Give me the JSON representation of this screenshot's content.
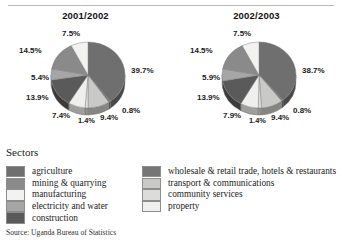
{
  "header": {
    "divider": "horizontal-rule"
  },
  "charts": [
    {
      "title": "2001/2002",
      "labels": [
        "39.7%",
        "0.8%",
        "9.4%",
        "1.4%",
        "7.4%",
        "13.9%",
        "5.4%",
        "14.5%",
        "7.5%"
      ]
    },
    {
      "title": "2002/2003",
      "labels": [
        "38.7%",
        "0.8%",
        "9.4%",
        "1.4%",
        "7.9%",
        "13.9%",
        "5.9%",
        "14.5%",
        "7.5%"
      ]
    }
  ],
  "legend": {
    "title": "Sectors",
    "left_items": [
      {
        "label": "agriculture",
        "color": "#6f6f6f"
      },
      {
        "label": "mining & quarrying",
        "color": "#8a8a8a"
      },
      {
        "label": "manufacturing",
        "color": "#f2f2f0"
      },
      {
        "label": "electricity and water",
        "color": "#a6a6a6"
      },
      {
        "label": "construction",
        "color": "#5a5a5a"
      }
    ],
    "right_items": [
      {
        "label": "wholesale & retail trade, hotels & restaurants",
        "color": "#767676"
      },
      {
        "label": "transport & communications",
        "color": "#c9c9c7"
      },
      {
        "label": "community services",
        "color": "#dcdcda"
      },
      {
        "label": "property",
        "color": "#efefed"
      }
    ]
  },
  "source": "Source: Uganda Bureau of Statistics",
  "chart_data": {
    "type": "pie",
    "title": "Sectors",
    "subtitle": "",
    "xlabel": "",
    "ylabel": "",
    "grid": false,
    "legend_position": "bottom",
    "categories": [
      "agriculture",
      "wholesale & retail trade, hotels & restaurants",
      "transport & communications",
      "community services",
      "property",
      "construction",
      "electricity and water",
      "mining & quarrying",
      "manufacturing"
    ],
    "category_colors": [
      "#6f6f6f",
      "#767676",
      "#c9c9c7",
      "#dcdcda",
      "#efefed",
      "#5a5a5a",
      "#a6a6a6",
      "#8a8a8a",
      "#f2f2f0"
    ],
    "series": [
      {
        "name": "2001/2002",
        "values": [
          39.7,
          0.8,
          9.4,
          1.4,
          7.4,
          13.9,
          5.4,
          14.5,
          7.5
        ]
      },
      {
        "name": "2002/2003",
        "values": [
          38.7,
          0.8,
          9.4,
          1.4,
          7.9,
          13.9,
          5.9,
          14.5,
          7.5
        ]
      }
    ],
    "value_unit": "%",
    "source": "Source: Uganda Bureau of Statistics"
  }
}
